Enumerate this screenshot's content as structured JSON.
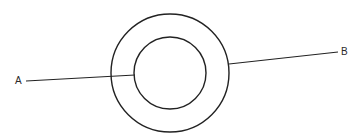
{
  "diagram": {
    "type": "concentric-circles",
    "stroke_color": "#222222",
    "background": "#ffffff",
    "outer_circle": {
      "cx": 170,
      "cy": 73,
      "r": 59
    },
    "inner_circle": {
      "cx": 170,
      "cy": 73,
      "r": 36
    },
    "line_a": {
      "x1": 26,
      "y1": 81,
      "x2": 135,
      "y2": 75
    },
    "line_b": {
      "x1": 229,
      "y1": 64,
      "x2": 338,
      "y2": 52
    },
    "labels": {
      "a": "A",
      "b": "B"
    }
  }
}
